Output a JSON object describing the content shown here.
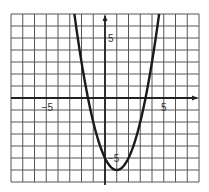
{
  "chart_data": {
    "type": "line",
    "title": "",
    "xlabel": "",
    "ylabel": "",
    "xlim": [
      -8,
      8
    ],
    "ylim": [
      -7,
      7
    ],
    "grid": true,
    "grid_step": 1,
    "x_tick_labels": [
      {
        "value": -5,
        "label": "−5"
      },
      {
        "value": 5,
        "label": "5"
      }
    ],
    "y_tick_labels": [
      {
        "value": 5,
        "label": "5"
      },
      {
        "value": -5,
        "label": "−5"
      }
    ],
    "series": [
      {
        "name": "y = x² − 2x − 5",
        "equation": "y = (x − 1)² − 6",
        "vertex": [
          1,
          -6
        ],
        "roots": [
          -1.45,
          3.45
        ],
        "x": [
          -2.6,
          -2,
          -1.45,
          -1,
          0,
          1,
          2,
          3,
          3.45,
          4,
          4.6
        ],
        "y": [
          7,
          3,
          0,
          -2,
          -5,
          -6,
          -5,
          -2,
          0,
          3,
          7
        ]
      }
    ]
  },
  "colors": {
    "grid": "#555555",
    "axis": "#222222",
    "curve": "#1a1a1a",
    "background": "#ffffff"
  }
}
